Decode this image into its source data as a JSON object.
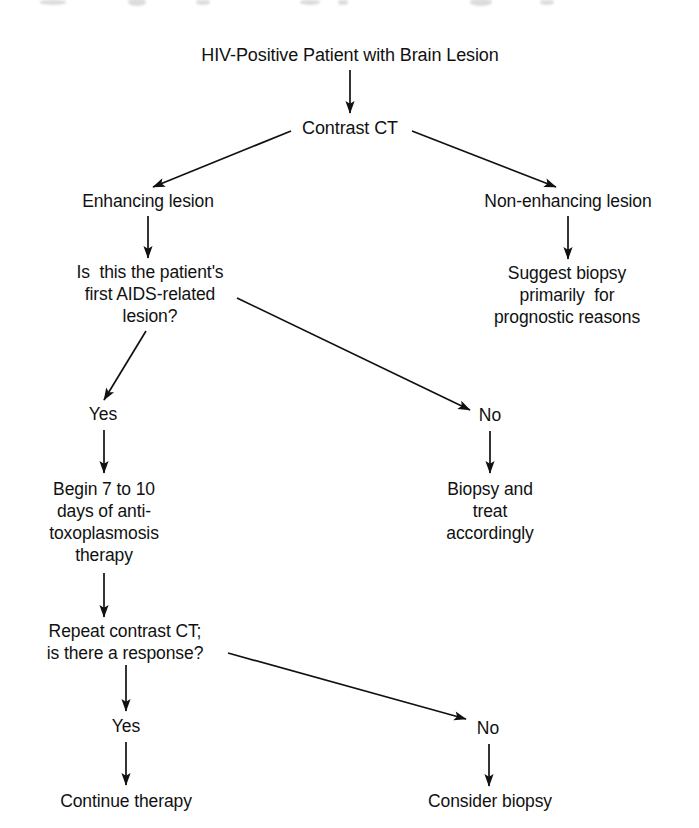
{
  "figure": {
    "kind": "clinical-decision-flowchart",
    "background_color": "#ffffff",
    "ink_color": "#111111",
    "width": 699,
    "height": 828
  },
  "nodes": {
    "root": "HIV-Positive Patient with Brain Lesion",
    "contrast_ct": "Contrast CT",
    "enhancing": "Enhancing lesion",
    "non_enhancing": "Non-enhancing lesion",
    "first_lesion_question": "Is  this the patient's\nfirst AIDS-related\nlesion?",
    "suggest_biopsy": "Suggest biopsy\nprimarily  for\nprognostic reasons",
    "begin_therapy": "Begin 7 to 10\ndays of anti-\ntoxoplasmosis\ntherapy",
    "biopsy_treat": "Biopsy and\ntreat\naccordingly",
    "repeat_ct_question": "Repeat contrast CT;\nis there a response?",
    "continue_therapy": "Continue therapy",
    "consider_biopsy": "Consider biopsy"
  },
  "branch_labels": {
    "first_lesion_yes": "Yes",
    "first_lesion_no": "No",
    "response_yes": "Yes",
    "response_no": "No"
  },
  "edges": [
    {
      "id": "root-to-ct",
      "from": "root",
      "to": "contrast_ct",
      "style": "straight-down"
    },
    {
      "id": "ct-to-enhancing",
      "from": "contrast_ct",
      "to": "enhancing",
      "style": "diagonal-left"
    },
    {
      "id": "ct-to-non-enhancing",
      "from": "contrast_ct",
      "to": "non_enhancing",
      "style": "diagonal-right"
    },
    {
      "id": "enhancing-to-question",
      "from": "enhancing",
      "to": "first_lesion_question",
      "style": "straight-down"
    },
    {
      "id": "nonenhancing-to-suggest",
      "from": "non_enhancing",
      "to": "suggest_biopsy",
      "style": "straight-down"
    },
    {
      "id": "question-to-yes",
      "from": "first_lesion_question",
      "to": "first_lesion_yes",
      "style": "diagonal-left"
    },
    {
      "id": "question-to-no",
      "from": "first_lesion_question",
      "to": "first_lesion_no",
      "style": "diagonal-right"
    },
    {
      "id": "yes-to-begin",
      "from": "first_lesion_yes",
      "to": "begin_therapy",
      "style": "straight-down"
    },
    {
      "id": "no-to-biopsy",
      "from": "first_lesion_no",
      "to": "biopsy_treat",
      "style": "straight-down"
    },
    {
      "id": "begin-to-repeat",
      "from": "begin_therapy",
      "to": "repeat_ct_question",
      "style": "straight-down"
    },
    {
      "id": "repeat-to-yes",
      "from": "repeat_ct_question",
      "to": "response_yes",
      "style": "straight-down"
    },
    {
      "id": "repeat-to-no",
      "from": "repeat_ct_question",
      "to": "response_no",
      "style": "diagonal-right"
    },
    {
      "id": "yes-to-continue",
      "from": "response_yes",
      "to": "continue_therapy",
      "style": "straight-down"
    },
    {
      "id": "no-to-consider",
      "from": "response_no",
      "to": "consider_biopsy",
      "style": "straight-down"
    }
  ]
}
